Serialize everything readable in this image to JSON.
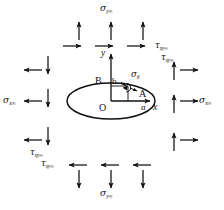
{
  "figure": {
    "type": "mechanics-stress-diagram",
    "background_color": "#ffffff",
    "ink_color": "#111111"
  },
  "labels": {
    "sigma_y_top": {
      "symbol": "σ",
      "subscript": "y∞"
    },
    "sigma_y_bottom": {
      "symbol": "σ",
      "subscript": "y∞"
    },
    "sigma_x_left": {
      "symbol": "σ",
      "subscript": "x∞"
    },
    "sigma_x_right": {
      "symbol": "σ",
      "subscript": "x∞"
    },
    "tau_top_right_1": {
      "symbol": "τ",
      "subscript": "xy∞"
    },
    "tau_top_right_2": {
      "symbol": "τ",
      "subscript": "xy∞"
    },
    "tau_bottom_left_1": {
      "symbol": "τ",
      "subscript": "xy∞"
    },
    "tau_bottom_left_2": {
      "symbol": "τ",
      "subscript": "xy∞"
    },
    "sigma_theta": {
      "symbol": "σ",
      "subscript": "θ"
    },
    "axis_x": "x",
    "axis_y": "y",
    "origin": "O",
    "point_a": "A",
    "point_b": "B",
    "semi_axis_a": "a",
    "semi_axis_b": "b"
  },
  "geometry": {
    "ellipse": {
      "cx": 111,
      "cy": 101,
      "rx": 44,
      "ry": 18
    },
    "origin": {
      "x": 111,
      "y": 101
    },
    "x_axis_arrow_end": {
      "x": 152,
      "y": 101
    },
    "y_axis_arrow_end": {
      "x": 111,
      "y": 52
    }
  },
  "arrows": {
    "top_outward_up": [
      {
        "x": 79,
        "y": 28
      },
      {
        "x": 111,
        "y": 28
      },
      {
        "x": 143,
        "y": 28
      }
    ],
    "top_shear_right": [
      {
        "x": 75,
        "y": 46
      },
      {
        "x": 107,
        "y": 46
      },
      {
        "x": 139,
        "y": 46
      }
    ],
    "bottom_outward_down": [
      {
        "x": 79,
        "y": 182
      },
      {
        "x": 111,
        "y": 182
      },
      {
        "x": 143,
        "y": 182
      }
    ],
    "bottom_shear_left": [
      {
        "x": 75,
        "y": 165
      },
      {
        "x": 107,
        "y": 165
      },
      {
        "x": 139,
        "y": 165
      }
    ],
    "left_outward_left": [
      {
        "x": 30,
        "y": 70
      },
      {
        "x": 30,
        "y": 101
      },
      {
        "x": 30,
        "y": 140
      }
    ],
    "left_shear_down": [
      {
        "x": 48,
        "y": 66
      },
      {
        "x": 48,
        "y": 99
      },
      {
        "x": 48,
        "y": 137
      }
    ],
    "right_outward_right": [
      {
        "x": 192,
        "y": 70
      },
      {
        "x": 192,
        "y": 101
      },
      {
        "x": 192,
        "y": 140
      }
    ],
    "right_shear_up": [
      {
        "x": 174,
        "y": 66
      },
      {
        "x": 174,
        "y": 99
      },
      {
        "x": 174,
        "y": 137
      }
    ]
  }
}
